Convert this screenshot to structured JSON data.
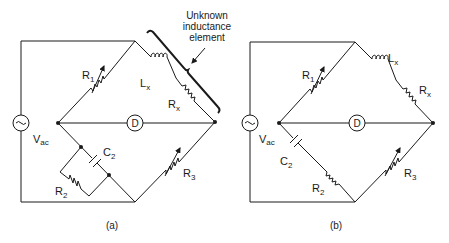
{
  "figure": {
    "panels": [
      {
        "id": "a",
        "caption": "(a)",
        "labels": {
          "source": "V",
          "source_sub": "ac",
          "r1": "R",
          "r1_sub": "1",
          "lx": "L",
          "lx_sub": "x",
          "rx": "R",
          "rx_sub": "x",
          "c2": "C",
          "c2_sub": "2",
          "r2": "R",
          "r2_sub": "2",
          "r3": "R",
          "r3_sub": "3",
          "detector": "D"
        },
        "annotation": [
          "Unknown",
          "inductance",
          "element"
        ]
      },
      {
        "id": "b",
        "caption": "(b)",
        "labels": {
          "source": "V",
          "source_sub": "ac",
          "r1": "R",
          "r1_sub": "1",
          "lx": "L",
          "lx_sub": "x",
          "rx": "R",
          "rx_sub": "x",
          "c2": "C",
          "c2_sub": "2",
          "r2": "R",
          "r2_sub": "2",
          "r3": "R",
          "r3_sub": "3",
          "detector": "D"
        }
      }
    ],
    "colors": {
      "line": "#1a1a1a",
      "background": "#ffffff"
    }
  }
}
